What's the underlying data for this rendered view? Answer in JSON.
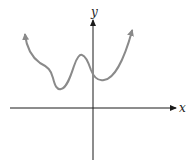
{
  "diagram": {
    "type": "function-graph",
    "axes": {
      "x_label": "x",
      "y_label": "y",
      "axis_color": "#1a1a1a"
    },
    "curve": {
      "color": "#8a8a8a",
      "description": "Continuous curve rising to infinity on both ends, with a local minimum left of the y-axis, a local maximum just left of the y-axis, and a local minimum just right of the y-axis; entirely above the x-axis",
      "features": [
        "left end arrow up",
        "shoulder",
        "local minimum",
        "local maximum",
        "y-intercept above x-axis",
        "local minimum",
        "right end arrow up"
      ]
    }
  }
}
